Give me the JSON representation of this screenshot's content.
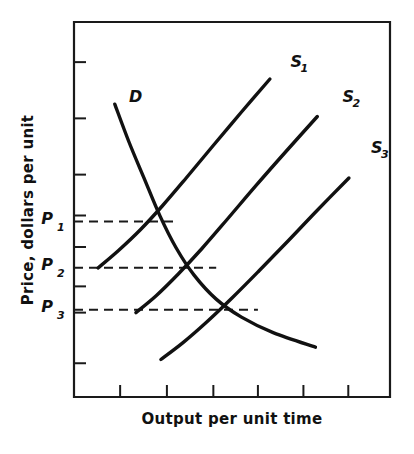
{
  "figure": {
    "background_color": "#ffffff",
    "ink_color": "#111111"
  },
  "axes": {
    "x_title": "Output per unit time",
    "y_title": "Price, dollars per unit"
  },
  "price_levels": [
    {
      "name": "P",
      "subscript": "1",
      "label": "P1"
    },
    {
      "name": "P",
      "subscript": "2",
      "label": "P2"
    },
    {
      "name": "P",
      "subscript": "3",
      "label": "P3"
    }
  ],
  "curves": [
    {
      "name": "D",
      "subscript": "",
      "label": "D",
      "kind": "demand"
    },
    {
      "name": "S",
      "subscript": "1",
      "label": "S1",
      "kind": "supply"
    },
    {
      "name": "S",
      "subscript": "2",
      "label": "S2",
      "kind": "supply"
    },
    {
      "name": "S",
      "subscript": "3",
      "label": "S3",
      "kind": "supply"
    }
  ],
  "chart_data": {
    "type": "line",
    "title": "",
    "subtitle": "",
    "xlabel": "Output per unit time",
    "ylabel": "Price, dollars per unit",
    "xlim": [
      0,
      100
    ],
    "ylim": [
      0,
      100
    ],
    "grid": false,
    "legend": "inline-curve-labels",
    "axis_tick_labels": {
      "x": [],
      "y": []
    },
    "x_tick_positions": [
      14.6,
      29.4,
      44.1,
      58.2,
      72.6,
      86.8
    ],
    "y_tick_positions": [
      89.3,
      74.3,
      59.3,
      48.4,
      40.0,
      29.5,
      22.5,
      9.0
    ],
    "series": [
      {
        "name": "D",
        "role": "demand",
        "label": "D",
        "label_point": {
          "x": 17.4,
          "y": 78.7
        },
        "points": [
          {
            "x": 12.9,
            "y": 78.1
          },
          {
            "x": 17.4,
            "y": 68.0
          },
          {
            "x": 22.1,
            "y": 58.5
          },
          {
            "x": 27.2,
            "y": 48.3
          },
          {
            "x": 32.3,
            "y": 39.8
          },
          {
            "x": 38.0,
            "y": 32.5
          },
          {
            "x": 45.0,
            "y": 26.1
          },
          {
            "x": 53.0,
            "y": 21.3
          },
          {
            "x": 63.2,
            "y": 17.1
          },
          {
            "x": 76.4,
            "y": 13.3
          }
        ]
      },
      {
        "name": "S1",
        "role": "supply",
        "label": "S1",
        "label_point": {
          "x": 68.5,
          "y": 88.0
        },
        "points": [
          {
            "x": 7.6,
            "y": 34.4
          },
          {
            "x": 14.0,
            "y": 39.0
          },
          {
            "x": 21.0,
            "y": 44.6
          },
          {
            "x": 28.0,
            "y": 51.0
          },
          {
            "x": 35.5,
            "y": 58.4
          },
          {
            "x": 44.0,
            "y": 67.0
          },
          {
            "x": 53.0,
            "y": 76.0
          },
          {
            "x": 62.0,
            "y": 84.8
          }
        ]
      },
      {
        "name": "S2",
        "role": "supply",
        "label": "S2",
        "label_point": {
          "x": 85.0,
          "y": 78.8
        },
        "points": [
          {
            "x": 19.6,
            "y": 22.5
          },
          {
            "x": 26.0,
            "y": 27.0
          },
          {
            "x": 33.0,
            "y": 32.8
          },
          {
            "x": 40.5,
            "y": 39.6
          },
          {
            "x": 48.5,
            "y": 47.4
          },
          {
            "x": 57.5,
            "y": 56.3
          },
          {
            "x": 67.0,
            "y": 65.4
          },
          {
            "x": 77.0,
            "y": 74.8
          }
        ]
      },
      {
        "name": "S3",
        "role": "supply",
        "label": "S3",
        "label_point": {
          "x": 94.0,
          "y": 65.0
        },
        "points": [
          {
            "x": 27.5,
            "y": 10.0
          },
          {
            "x": 34.5,
            "y": 14.5
          },
          {
            "x": 42.0,
            "y": 20.0
          },
          {
            "x": 50.0,
            "y": 26.4
          },
          {
            "x": 58.5,
            "y": 33.6
          },
          {
            "x": 67.5,
            "y": 41.4
          },
          {
            "x": 77.0,
            "y": 49.8
          },
          {
            "x": 87.0,
            "y": 58.4
          }
        ]
      }
    ],
    "equilibria": [
      {
        "price_label": "P1",
        "demand_curve": "D",
        "supply_curve": "S1",
        "x": 32.3,
        "y": 46.8
      },
      {
        "price_label": "P2",
        "demand_curve": "D",
        "supply_curve": "S2",
        "x": 45.0,
        "y": 34.5
      },
      {
        "price_label": "P3",
        "demand_curve": "D",
        "supply_curve": "S3",
        "x": 58.2,
        "y": 23.3
      }
    ],
    "annotations": [
      {
        "text": "P1",
        "type": "price-level",
        "y": 46.8
      },
      {
        "text": "P2",
        "type": "price-level",
        "y": 34.5
      },
      {
        "text": "P3",
        "type": "price-level",
        "y": 23.3
      }
    ]
  }
}
